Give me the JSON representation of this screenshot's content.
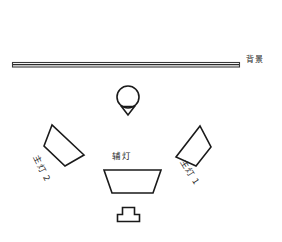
{
  "diagram": {
    "type": "lighting-setup-top-view",
    "canvas": {
      "width": 282,
      "height": 242
    },
    "stroke_color": "#1a1a1a",
    "background_color": "#ffffff",
    "labels": {
      "background": "背景",
      "fill_light": "辅灯",
      "key_light_1": "主灯 1",
      "key_light_2": "主灯 2"
    },
    "elements": [
      {
        "name": "background-bar",
        "label": "背景",
        "shape": "bar",
        "x": 12,
        "y": 62,
        "width": 228,
        "height": 5
      },
      {
        "name": "subject",
        "label": "",
        "shape": "circle-with-nose",
        "cx": 128,
        "cy": 97,
        "r": 11
      },
      {
        "name": "key-light-2",
        "label": "主灯 2",
        "shape": "quadrilateral",
        "points": "52,125 44,146 65,166 84,155"
      },
      {
        "name": "key-light-1",
        "label": "主灯 1",
        "shape": "quadrilateral",
        "points": "200,126 176,157 196,166 210,147"
      },
      {
        "name": "fill-light",
        "label": "辅灯",
        "shape": "trapezoid",
        "points": "104,170 160,170 152,193 112,193"
      },
      {
        "name": "camera",
        "label": "",
        "shape": "camera-top-view",
        "x": 117,
        "y": 207,
        "width": 22,
        "height": 15
      }
    ]
  }
}
